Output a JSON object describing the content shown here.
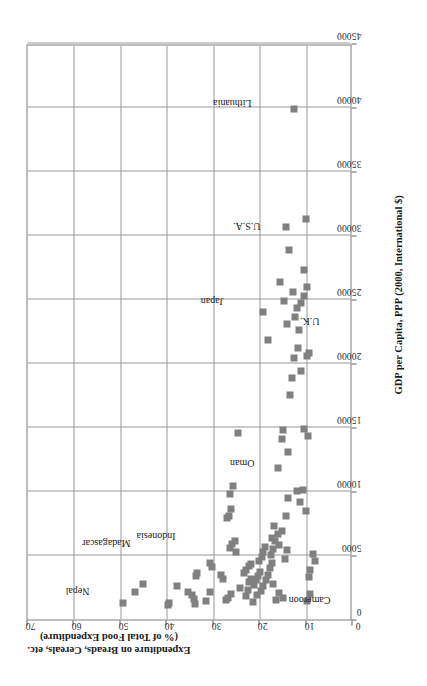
{
  "chart_data": {
    "type": "scatter",
    "title": "",
    "xlabel": "GDP per Capita, PPP (2000, International $)",
    "ylabel_line1": "Expenditure on Breads, Cereals, etc.",
    "ylabel_line2": "(% of Total Food Expenditure)",
    "xlim": [
      0,
      45000
    ],
    "ylim": [
      0,
      70
    ],
    "xticks": [
      0,
      5000,
      10000,
      15000,
      20000,
      25000,
      30000,
      35000,
      40000,
      45000
    ],
    "xtick_labels": [
      "0",
      "5000",
      "10000",
      "15000",
      "20000",
      "25000",
      "30000",
      "35000",
      "40000",
      "45000"
    ],
    "yticks": [
      0,
      10,
      20,
      30,
      40,
      50,
      60,
      70
    ],
    "ytick_labels": [
      "0",
      "10",
      "20",
      "30",
      "40",
      "50",
      "60",
      "70"
    ],
    "grid": true,
    "legend": "none",
    "marker_color": "#808080",
    "trend_color": "#000000",
    "series": [
      {
        "name": "Countries",
        "points": [
          [
            1300,
            49.5
          ],
          [
            2150,
            46.8
          ],
          [
            2150,
            35.5
          ],
          [
            2800,
            45.2
          ],
          [
            1150,
            39.8
          ],
          [
            1250,
            39.6
          ],
          [
            2600,
            37.8
          ],
          [
            1900,
            34.5
          ],
          [
            3400,
            33.8
          ],
          [
            3600,
            33.5
          ],
          [
            4400,
            30.6
          ],
          [
            4100,
            30.2
          ],
          [
            1600,
            34.2
          ],
          [
            1200,
            34.0
          ],
          [
            1450,
            31.5
          ],
          [
            2150,
            30.6
          ],
          [
            3150,
            28.0
          ],
          [
            3500,
            28.4
          ],
          [
            5600,
            26.3
          ],
          [
            5900,
            26.0
          ],
          [
            5250,
            25.2
          ],
          [
            6150,
            25.3
          ],
          [
            8600,
            26.1
          ],
          [
            9800,
            26.4
          ],
          [
            7900,
            27.0
          ],
          [
            8050,
            26.5
          ],
          [
            10400,
            25.7
          ],
          [
            14600,
            24.7
          ],
          [
            1500,
            27.3
          ],
          [
            1700,
            26.8
          ],
          [
            2000,
            26.2
          ],
          [
            2450,
            24.2
          ],
          [
            1800,
            23.0
          ],
          [
            2300,
            22.6
          ],
          [
            2900,
            22.2
          ],
          [
            3200,
            21.8
          ],
          [
            3650,
            23.4
          ],
          [
            3900,
            23.0
          ],
          [
            4150,
            22.4
          ],
          [
            4350,
            21.9
          ],
          [
            2700,
            21.2
          ],
          [
            3050,
            20.8
          ],
          [
            3400,
            20.4
          ],
          [
            3700,
            19.9
          ],
          [
            4550,
            20.1
          ],
          [
            4900,
            19.6
          ],
          [
            5300,
            19.2
          ],
          [
            5700,
            18.8
          ],
          [
            1350,
            21.4
          ],
          [
            1900,
            20.5
          ],
          [
            2250,
            19.8
          ],
          [
            2650,
            19.3
          ],
          [
            3100,
            18.7
          ],
          [
            3500,
            18.2
          ],
          [
            4000,
            17.8
          ],
          [
            4400,
            17.3
          ],
          [
            5000,
            17.6
          ],
          [
            5500,
            17.1
          ],
          [
            6100,
            16.6
          ],
          [
            6700,
            16.1
          ],
          [
            7300,
            16.9
          ],
          [
            6400,
            17.4
          ],
          [
            5850,
            15.8
          ],
          [
            6950,
            15.2
          ],
          [
            1500,
            16.5
          ],
          [
            2100,
            15.9
          ],
          [
            4750,
            14.6
          ],
          [
            5400,
            14.2
          ],
          [
            8100,
            14.4
          ],
          [
            9500,
            13.9
          ],
          [
            10000,
            12.0
          ],
          [
            10100,
            10.6
          ],
          [
            9200,
            11.3
          ],
          [
            8500,
            10.1
          ],
          [
            11800,
            16.0
          ],
          [
            13100,
            13.8
          ],
          [
            14100,
            15.1
          ],
          [
            14800,
            14.9
          ],
          [
            14900,
            10.4
          ],
          [
            14300,
            9.6
          ],
          [
            17500,
            13.4
          ],
          [
            18900,
            13.0
          ],
          [
            20400,
            12.6
          ],
          [
            20600,
            9.9
          ],
          [
            19400,
            11.0
          ],
          [
            21200,
            11.8
          ],
          [
            21800,
            18.3
          ],
          [
            22600,
            11.6
          ],
          [
            23100,
            14.1
          ],
          [
            23600,
            12.3
          ],
          [
            24300,
            12.0
          ],
          [
            24000,
            19.2
          ],
          [
            24700,
            11.2
          ],
          [
            24900,
            14.7
          ],
          [
            25300,
            10.5
          ],
          [
            25600,
            12.8
          ],
          [
            26000,
            9.8
          ],
          [
            26400,
            15.6
          ],
          [
            27300,
            10.4
          ],
          [
            28900,
            13.6
          ],
          [
            30700,
            14.4
          ],
          [
            31300,
            10.0
          ],
          [
            39900,
            12.5
          ],
          [
            5100,
            8.6
          ],
          [
            4600,
            8.0
          ],
          [
            3850,
            9.1
          ],
          [
            3350,
            9.4
          ],
          [
            2000,
            9.2
          ],
          [
            1450,
            9.8
          ],
          [
            1650,
            15.0
          ],
          [
            2750,
            17.2
          ],
          [
            20800,
            9.4
          ]
        ]
      }
    ],
    "trend": {
      "type": "exponential",
      "description": "smoothed negative-exponential fit",
      "points": [
        [
          1050,
          34.0
        ],
        [
          1500,
          30.5
        ],
        [
          2000,
          28.0
        ],
        [
          2600,
          26.0
        ],
        [
          3400,
          24.0
        ],
        [
          4400,
          22.2
        ],
        [
          5600,
          20.6
        ],
        [
          7000,
          19.2
        ],
        [
          8800,
          17.8
        ],
        [
          11000,
          16.4
        ],
        [
          13500,
          15.2
        ],
        [
          16500,
          14.2
        ],
        [
          20000,
          13.4
        ],
        [
          24000,
          12.8
        ],
        [
          28500,
          12.3
        ],
        [
          33500,
          11.9
        ],
        [
          38000,
          11.6
        ],
        [
          40500,
          11.5
        ]
      ]
    },
    "annotations": [
      {
        "label": "Nepal",
        "text_x": 1900,
        "text_y": 56.5,
        "arrow": false,
        "tip_x": null,
        "tip_y": null
      },
      {
        "label": "Madagascar",
        "text_x": 5600,
        "text_y": 47.5,
        "arrow": true,
        "tip_x": 2250,
        "tip_y": 46.8
      },
      {
        "label": "Indonesia",
        "text_x": 6200,
        "text_y": 38.0,
        "arrow": true,
        "tip_x": 4300,
        "tip_y": 31.2
      },
      {
        "label": "Oman",
        "text_x": 11900,
        "text_y": 21.0,
        "arrow": false,
        "tip_x": null,
        "tip_y": null
      },
      {
        "label": "Cameroon",
        "text_x": 1200,
        "text_y": 4.5,
        "arrow": true,
        "tip_x": 1700,
        "tip_y": 15.0
      },
      {
        "label": "Japan",
        "text_x": 24500,
        "text_y": 27.5,
        "arrow": false,
        "tip_x": null,
        "tip_y": null
      },
      {
        "label": "U.S.A.",
        "text_x": 30400,
        "text_y": 19.5,
        "arrow": false,
        "tip_x": null,
        "tip_y": null
      },
      {
        "label": "U.K.",
        "text_x": 23000,
        "text_y": 6.8,
        "arrow": false,
        "tip_x": null,
        "tip_y": null
      },
      {
        "label": "Lithuania",
        "text_x": 40000,
        "text_y": 21.5,
        "arrow": false,
        "tip_x": null,
        "tip_y": null
      }
    ]
  }
}
